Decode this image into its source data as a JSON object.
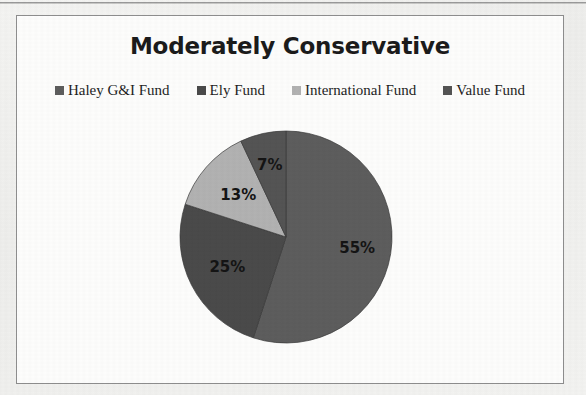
{
  "document": {
    "background_color": "#f1f1ef",
    "frame_color": "#8e8e8e",
    "plot_background": "#fdfdfc"
  },
  "chart_title": "Moderately Conservative",
  "legend": {
    "position": "top",
    "items": [
      {
        "label": "Haley G&I Fund",
        "color": "#5d5d5d",
        "swatch_name": "legend-swatch-haley"
      },
      {
        "label": "Ely Fund",
        "color": "#4a4a4a",
        "swatch_name": "legend-swatch-ely"
      },
      {
        "label": "International Fund",
        "color": "#b2b2b2",
        "swatch_name": "legend-swatch-international"
      },
      {
        "label": "Value Fund",
        "color": "#545454",
        "swatch_name": "legend-swatch-value"
      }
    ]
  },
  "chart_data": {
    "type": "pie",
    "title": "Moderately Conservative",
    "xlabel": "",
    "ylabel": "",
    "categories": [
      "Haley G&I Fund",
      "Ely Fund",
      "International Fund",
      "Value Fund"
    ],
    "values": [
      55,
      25,
      13,
      7
    ],
    "value_unit": "%",
    "data_labels": [
      "55%",
      "25%",
      "13%",
      "7%"
    ],
    "colors": [
      "#5d5d5d",
      "#4a4a4a",
      "#b2b2b2",
      "#545454"
    ],
    "legend_position": "top",
    "grid": false,
    "start_angle_deg": 0,
    "direction": "clockwise",
    "slices": [
      {
        "name": "Haley G&I Fund",
        "value": 55,
        "label": "55%",
        "color": "#5d5d5d",
        "start_deg": 0,
        "end_deg": 198
      },
      {
        "name": "Ely Fund",
        "value": 25,
        "label": "25%",
        "color": "#4a4a4a",
        "start_deg": 198,
        "end_deg": 288
      },
      {
        "name": "International Fund",
        "value": 13,
        "label": "13%",
        "color": "#b2b2b2",
        "start_deg": 288,
        "end_deg": 334.8
      },
      {
        "name": "Value Fund",
        "value": 7,
        "label": "7%",
        "color": "#545454",
        "start_deg": 334.8,
        "end_deg": 360
      }
    ]
  },
  "labels": {
    "slice_55": "55%",
    "slice_25": "25%",
    "slice_13": "13%",
    "slice_7": "7%"
  }
}
